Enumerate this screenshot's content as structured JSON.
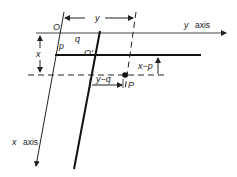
{
  "diagram": {
    "labels": {
      "origin": "O",
      "origin_prime": "O'",
      "p": "p",
      "q": "q",
      "y_dim": "y",
      "x_dim": "x",
      "y_axis_var": "y",
      "y_axis_word": "axis",
      "x_axis_var": "x",
      "x_axis_word": "axis",
      "x_minus_p": "x−p",
      "y_minus_q": "y−q",
      "point": "P"
    },
    "colors": {
      "line": "#222222",
      "background": "#ffffff"
    }
  }
}
